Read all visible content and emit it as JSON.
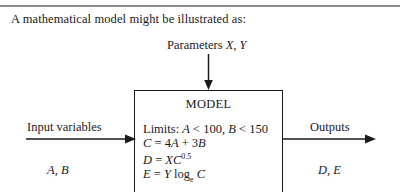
{
  "figure": {
    "intro_text": "A mathematical model might be illustrated as:",
    "parameters": {
      "label": "Parameters",
      "variables": "X, Y"
    },
    "model_box": {
      "title": "MODEL",
      "equations": [
        "Limits: A < 100, B < 150",
        "C = 4A + 3B",
        "D = XC",
        "E = Y log",
        "C"
      ],
      "limits_text": "Limits: A < 100, B < 150",
      "limits_prefix": "Limits:",
      "limits_a_var": "A",
      "limits_a_rest": "< 100,",
      "limits_b_var": "B",
      "limits_b_rest": "< 150",
      "eq_c_lhs": "C",
      "eq_c_rhs_eq": "= 4",
      "eq_c_var_a": "A",
      "eq_c_plus": "+ 3",
      "eq_c_var_b": "B",
      "eq_d_lhs": "D",
      "eq_d_eq": "=",
      "eq_d_var_x": "X",
      "eq_d_var_c": "C",
      "eq_d_exponent": "0.5",
      "eq_e_lhs": "E",
      "eq_e_eq": "=",
      "eq_e_var_y": "Y",
      "eq_e_log": "log",
      "eq_e_log_sub": "e",
      "eq_e_var_c": "C"
    },
    "input": {
      "label": "Input variables",
      "variables": "A, B"
    },
    "output": {
      "label": "Outputs",
      "variables": "D, E"
    },
    "colors": {
      "background": "#ffffff",
      "ink": "#1a1a1a",
      "rule": "#8c8c8c"
    }
  }
}
